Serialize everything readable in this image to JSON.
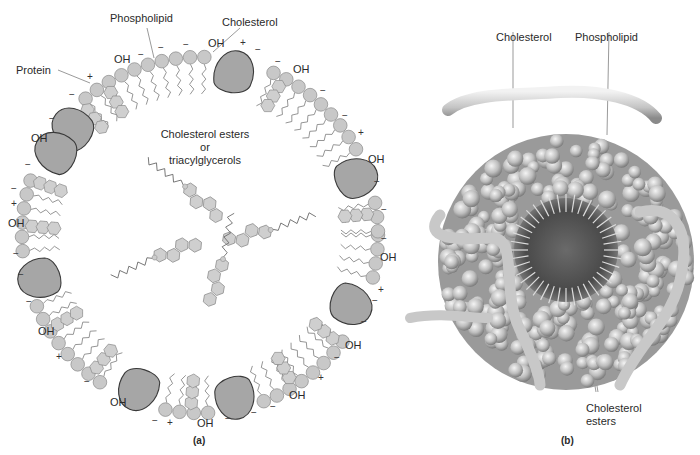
{
  "panel_a": {
    "caption": "(a)",
    "labels": {
      "phospholipid": "Phospholipid",
      "cholesterol": "Cholesterol",
      "protein": "Protein",
      "core_line1": "Cholesterol esters",
      "core_line2": "or",
      "core_line3": "triacylglycerols"
    },
    "oh_label": "OH",
    "plus": "+",
    "minus": "−",
    "colors": {
      "headgroup": "#c8c8c8",
      "headgroup_stroke": "#8a8a8a",
      "protein_fill": "#a6a6a6",
      "protein_stroke": "#3a3a3a",
      "tail": "#777777"
    }
  },
  "panel_b": {
    "caption": "(b)",
    "labels": {
      "cholesterol": "Cholesterol",
      "phospholipid": "Phospholipid",
      "esters_line1": "Cholesterol",
      "esters_line2": "esters"
    },
    "colors": {
      "sphere_light": "#e6e6e6",
      "sphere_mid": "#b5b5b5",
      "sphere_dark": "#6f6f6f",
      "core_dark": "#4a4a4a"
    }
  }
}
